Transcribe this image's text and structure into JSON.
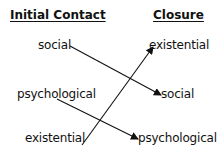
{
  "headers": {
    "left": "Initial Contact",
    "right": "Closure"
  },
  "left_column": [
    {
      "id": "social",
      "label": "social"
    },
    {
      "id": "psychological",
      "label": "psychological"
    },
    {
      "id": "existential",
      "label": "existential"
    }
  ],
  "right_column": [
    {
      "id": "existential",
      "label": "existential"
    },
    {
      "id": "social",
      "label": "social"
    },
    {
      "id": "psychological",
      "label": "psychological"
    }
  ],
  "connections": [
    {
      "from": "social",
      "to": "social"
    },
    {
      "from": "psychological",
      "to": "psychological"
    },
    {
      "from": "existential",
      "to": "existential"
    }
  ],
  "colors": {
    "text": "#111111",
    "line": "#111111",
    "background": "#ffffff"
  }
}
